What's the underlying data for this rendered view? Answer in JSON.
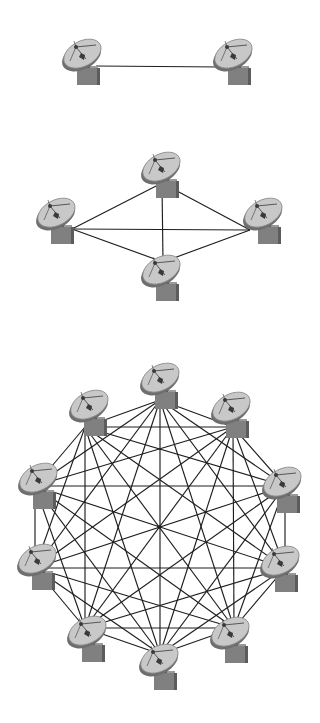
{
  "canvas": {
    "width": 320,
    "height": 723,
    "background": "#ffffff"
  },
  "colors": {
    "link": "#1e1e1e",
    "dish_face": "#c8c8c8",
    "dish_rim": "#8a8a8a",
    "dish_shadow": "#6e6e6e",
    "dish_feed": "#3a3a3a",
    "box_front": "#808080",
    "box_side": "#5c5c5c",
    "box_top": "#9a9a9a"
  },
  "icon": {
    "name": "satellite-dish-icon",
    "scale": 1.0
  },
  "networks": [
    {
      "id": "network-2-nodes",
      "label": "Two-station point-to-point link",
      "nodes": [
        {
          "id": "n1",
          "dish": [
            82,
            55
          ],
          "anchor": [
            96,
            66
          ]
        },
        {
          "id": "n2",
          "dish": [
            233,
            55
          ],
          "anchor": [
            222,
            67
          ]
        }
      ],
      "edges": [
        [
          0,
          1
        ]
      ]
    },
    {
      "id": "network-4-nodes",
      "label": "Four-station fully connected mesh",
      "nodes": [
        {
          "id": "top",
          "dish": [
            161,
            168
          ],
          "anchor": [
            162,
            183
          ]
        },
        {
          "id": "left",
          "dish": [
            56,
            214
          ],
          "anchor": [
            72,
            229
          ]
        },
        {
          "id": "right",
          "dish": [
            263,
            214
          ],
          "anchor": [
            250,
            230
          ]
        },
        {
          "id": "bottom",
          "dish": [
            161,
            271
          ],
          "anchor": [
            163,
            262
          ]
        }
      ],
      "edges": [
        [
          0,
          1
        ],
        [
          0,
          2
        ],
        [
          0,
          3
        ],
        [
          1,
          2
        ],
        [
          1,
          3
        ],
        [
          2,
          3
        ]
      ]
    },
    {
      "id": "network-10-nodes",
      "label": "Ten-station fully connected mesh",
      "center": [
        159,
        527
      ],
      "nodes": [
        {
          "id": "top",
          "dish": [
            160,
            379
          ],
          "anchor": [
            160,
            400
          ]
        },
        {
          "id": "top-right",
          "dish": [
            231,
            408
          ],
          "anchor": [
            233,
            427
          ]
        },
        {
          "id": "right-upper",
          "dish": [
            282,
            483
          ],
          "anchor": [
            285,
            486
          ]
        },
        {
          "id": "right-lower",
          "dish": [
            280,
            562
          ],
          "anchor": [
            285,
            568
          ]
        },
        {
          "id": "bottom-right",
          "dish": [
            230,
            633
          ],
          "anchor": [
            234,
            628
          ]
        },
        {
          "id": "bottom",
          "dish": [
            159,
            660
          ],
          "anchor": [
            160,
            654
          ]
        },
        {
          "id": "bottom-left",
          "dish": [
            87,
            632
          ],
          "anchor": [
            85,
            628
          ]
        },
        {
          "id": "left-lower",
          "dish": [
            37,
            560
          ],
          "anchor": [
            35,
            568
          ]
        },
        {
          "id": "left-upper",
          "dish": [
            38,
            479
          ],
          "anchor": [
            35,
            486
          ]
        },
        {
          "id": "top-left",
          "dish": [
            89,
            406
          ],
          "anchor": [
            85,
            427
          ]
        }
      ],
      "edges": "complete"
    }
  ]
}
